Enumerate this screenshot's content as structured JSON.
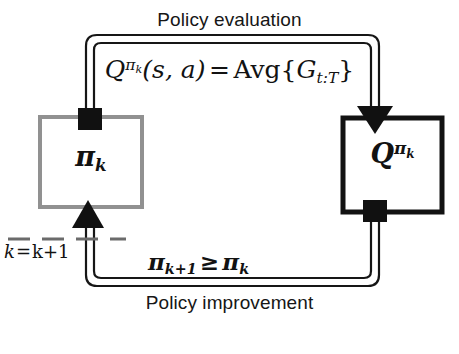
{
  "figure": {
    "kind": "generalized-policy-iteration-cycle",
    "background_color": "#ffffff"
  },
  "labels": {
    "policy_evaluation": "Policy evaluation",
    "policy_improvement": "Policy improvement"
  },
  "equations": {
    "evaluation": {
      "lhs_symbol": "Q",
      "lhs_superscript": "π",
      "lhs_superscript_subscript": "k",
      "lhs_args": "(s, a)",
      "relation": "=",
      "rhs_function": "Avg",
      "rhs_arg_symbol": "G",
      "rhs_arg_subscript": "t:T",
      "plain": "Q^{π_k}(s, a) = Avg{G_{t:T}}"
    },
    "improvement": {
      "lhs_symbol": "π",
      "lhs_subscript": "k+1",
      "relation": "≥",
      "rhs_symbol": "π",
      "rhs_subscript": "k",
      "plain": "π_{k+1} ≥ π_k"
    },
    "counter_update": {
      "lhs": "k",
      "relation": "=",
      "rhs": "k+1",
      "plain": "k = k+1"
    }
  },
  "nodes": [
    {
      "id": "policy-box",
      "label_symbol": "π",
      "label_subscript": "k",
      "plain_label": "π_k",
      "border_color": "#919191",
      "fill_color": "#ffffff"
    },
    {
      "id": "qvalue-box",
      "label_symbol": "Q",
      "label_superscript": "π",
      "label_superscript_subscript": "k",
      "plain_label": "Q^{π_k}",
      "border_color": "#121212",
      "fill_color": "#ffffff"
    }
  ],
  "connectors": {
    "evaluation_pipe": {
      "from": "policy-box",
      "to": "qvalue-box",
      "direction": "left-to-right-over-top",
      "start_marker": "square",
      "end_marker": "arrowhead",
      "color": "#161616"
    },
    "improvement_pipe": {
      "from": "qvalue-box",
      "to": "policy-box",
      "direction": "right-to-left-under-bottom",
      "start_marker": "square",
      "end_marker": "arrowhead",
      "color": "#161616"
    },
    "counter_dashed_line": {
      "style": "dashed",
      "color": "#6b6b6b"
    }
  }
}
